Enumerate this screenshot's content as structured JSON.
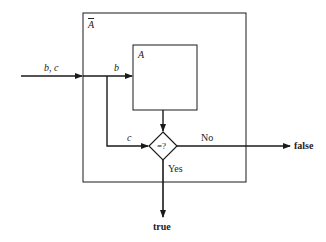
{
  "diagram": {
    "outer_box": {
      "label": "A",
      "label_overline": true
    },
    "inner_box": {
      "label": "A"
    },
    "input_label": "b, c",
    "branch_b_label": "b",
    "branch_c_label": "c",
    "decision": {
      "label": "=?"
    },
    "no_label": "No",
    "yes_label": "Yes",
    "false_output": "false",
    "true_output": "true",
    "colors": {
      "line": "#1a1a1a",
      "background": "#ffffff"
    }
  }
}
